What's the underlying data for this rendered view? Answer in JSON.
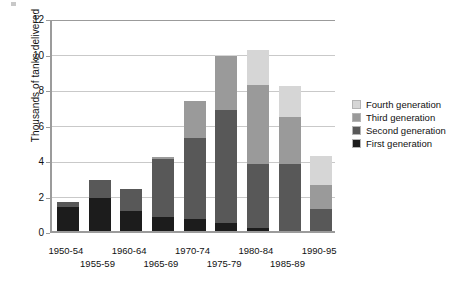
{
  "chart_data": {
    "type": "bar",
    "subtype": "stacked-bar",
    "title": "",
    "xlabel": "",
    "ylabel": "Thousands of tanks delivered",
    "ylim": [
      0,
      12
    ],
    "yticks": [
      0,
      2,
      4,
      6,
      8,
      10,
      12
    ],
    "ytick_labels": [
      "0",
      "2",
      "4",
      "6",
      "8",
      "10",
      "12"
    ],
    "grid": "horizontal",
    "legend_position": "right",
    "categories": [
      "1950-54",
      "1955-59",
      "1960-64",
      "1965-69",
      "1970-74",
      "1975-79",
      "1980-84",
      "1985-89",
      "1990-95"
    ],
    "series": [
      {
        "name": "First generation",
        "color": "#1c1c1c",
        "values": [
          1.35,
          1.85,
          1.1,
          0.8,
          0.7,
          0.45,
          0.15,
          0.0,
          0.0
        ]
      },
      {
        "name": "Second generation",
        "color": "#585858",
        "values": [
          0.3,
          1.05,
          1.25,
          3.25,
          4.55,
          6.35,
          3.6,
          3.8,
          1.25
        ]
      },
      {
        "name": "Third generation",
        "color": "#9a9a9a",
        "values": [
          0.0,
          0.0,
          0.0,
          0.1,
          2.05,
          3.05,
          4.5,
          2.6,
          1.35
        ]
      },
      {
        "name": "Fourth generation",
        "color": "#d6d6d6",
        "values": [
          0.0,
          0.0,
          0.0,
          0.0,
          0.0,
          0.05,
          1.95,
          1.75,
          1.6
        ]
      }
    ],
    "totals": [
      1.65,
      2.9,
      2.35,
      4.15,
      7.3,
      9.9,
      10.2,
      8.15,
      4.2
    ],
    "legend_entries": [
      "Fourth generation",
      "Third generation",
      "Second generation",
      "First generation"
    ],
    "axis_color": "#9b9b9b",
    "gridline_color": "#c9c9c9",
    "background": "#ffffff"
  }
}
